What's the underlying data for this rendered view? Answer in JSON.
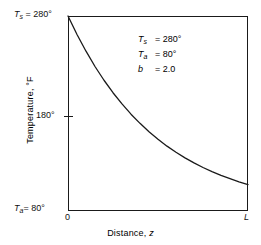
{
  "figure": {
    "background_color": "#ffffff",
    "line_color": "#1a1a1a"
  },
  "axes": {
    "y_title": "Temperature, °F",
    "x_title_prefix": "Distance, ",
    "x_title_variable": "z",
    "x_tick_left": "0",
    "x_tick_right": "L",
    "y_label_top_var": "T",
    "y_label_top_sub": "s",
    "y_label_top_value": "= 280°",
    "y_label_mid": "180°",
    "y_label_bottom_var": "T",
    "y_label_bottom_sub": "a",
    "y_label_bottom_value": "= 80°"
  },
  "annotation": {
    "line1_var": "T",
    "line1_sub": "s",
    "line1_value": "= 280°",
    "line2_var": "T",
    "line2_sub": "a",
    "line2_value": "= 80°",
    "line3_var": "b",
    "line3_sub": "",
    "line3_value": "= 2.0"
  },
  "chart_data": {
    "type": "line",
    "title": "",
    "xlabel": "Distance, z",
    "ylabel": "Temperature, °F",
    "xlim": [
      0,
      1
    ],
    "ylim": [
      80,
      280
    ],
    "xtick_labels": [
      "0",
      "L"
    ],
    "xtick_values": [
      0,
      1
    ],
    "ytick_labels": [
      "80°",
      "180°",
      "280°"
    ],
    "ytick_values": [
      80,
      180,
      280
    ],
    "grid": false,
    "legend": null,
    "parameters": {
      "Ts": 280,
      "Ta": 80,
      "b": 2.0,
      "equation": "T = Ta + (Ts - Ta) * exp(-b * z / L)"
    },
    "series": [
      {
        "name": "Temperature profile",
        "x": [
          0,
          0.05,
          0.1,
          0.15,
          0.2,
          0.25,
          0.3,
          0.35,
          0.4,
          0.45,
          0.5,
          0.55,
          0.6,
          0.65,
          0.7,
          0.75,
          0.8,
          0.85,
          0.9,
          0.95,
          1.0
        ],
        "y": [
          280.0,
          261.0,
          243.9,
          228.2,
          214.1,
          201.3,
          189.8,
          179.3,
          169.9,
          161.3,
          153.6,
          146.5,
          140.2,
          134.5,
          129.3,
          124.6,
          120.4,
          116.5,
          113.1,
          109.9,
          107.1
        ]
      }
    ]
  }
}
